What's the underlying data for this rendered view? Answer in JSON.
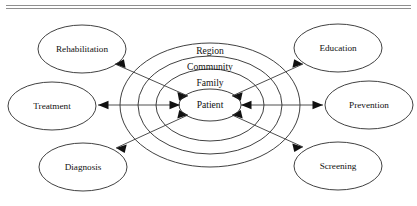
{
  "figure": {
    "background_color": "#ffffff",
    "stroke_color": "#2b2b2b",
    "text_color": "#111111",
    "rule_color": "#8f8f8f"
  },
  "rings": {
    "center": {
      "x": 210,
      "y": 105
    },
    "items": [
      {
        "label": "Region",
        "rx": 90,
        "ry": 62,
        "label_x": 210,
        "label_y": 52
      },
      {
        "label": "Community",
        "rx": 72,
        "ry": 49,
        "label_x": 210,
        "label_y": 68
      },
      {
        "label": "Family",
        "rx": 54,
        "ry": 36,
        "label_x": 210,
        "label_y": 84
      },
      {
        "label": "Patient",
        "rx": 31,
        "ry": 16,
        "label_x": 210,
        "label_y": 105
      }
    ]
  },
  "nodes": [
    {
      "name": "rehabilitation",
      "label": "Rehabilitation",
      "cx": 82,
      "cy": 49,
      "rx": 44,
      "ry": 24
    },
    {
      "name": "treatment",
      "label": "Treatment",
      "cx": 52,
      "cy": 106,
      "rx": 44,
      "ry": 24
    },
    {
      "name": "diagnosis",
      "label": "Diagnosis",
      "cx": 83,
      "cy": 167,
      "rx": 44,
      "ry": 24
    },
    {
      "name": "education",
      "label": "Education",
      "cx": 338,
      "cy": 48,
      "rx": 44,
      "ry": 24
    },
    {
      "name": "prevention",
      "label": "Prevention",
      "cx": 369,
      "cy": 105,
      "rx": 44,
      "ry": 24
    },
    {
      "name": "screening",
      "label": "Screening",
      "cx": 338,
      "cy": 166,
      "rx": 44,
      "ry": 24
    }
  ],
  "connectors": [
    {
      "name": "patient-to-rehabilitation",
      "x1": 188,
      "y1": 96,
      "x2": 115,
      "y2": 64,
      "双": true
    },
    {
      "name": "patient-to-treatment",
      "x1": 180,
      "y1": 105,
      "x2": 98,
      "y2": 105,
      "双": true
    },
    {
      "name": "patient-to-diagnosis",
      "x1": 188,
      "y1": 115,
      "x2": 116,
      "y2": 148,
      "双": true
    },
    {
      "name": "patient-to-education",
      "x1": 232,
      "y1": 96,
      "x2": 303,
      "y2": 64,
      "双": true
    },
    {
      "name": "patient-to-prevention",
      "x1": 241,
      "y1": 105,
      "x2": 323,
      "y2": 105,
      "双": true
    },
    {
      "name": "patient-to-screening",
      "x1": 232,
      "y1": 115,
      "x2": 303,
      "y2": 147,
      "双": true
    }
  ],
  "rules": {
    "top_line_label": "top-rule",
    "bottom_line_label": "second-rule"
  }
}
